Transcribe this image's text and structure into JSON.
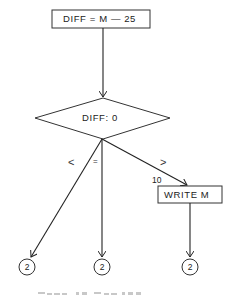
{
  "diagram": {
    "type": "flowchart",
    "nodes": {
      "assign": {
        "shape": "rectangle",
        "label": "DIFF = M — 25"
      },
      "decision": {
        "shape": "diamond",
        "label": "DIFF:  0"
      },
      "write": {
        "shape": "rectangle",
        "label": "WRITE   M",
        "step_number": "10"
      },
      "connectors": [
        {
          "shape": "circle",
          "label": "2"
        },
        {
          "shape": "circle",
          "label": "2"
        },
        {
          "shape": "circle",
          "label": "2"
        }
      ]
    },
    "edges": [
      {
        "from": "assign",
        "to": "decision",
        "label": ""
      },
      {
        "from": "decision",
        "to": "connector-1",
        "label": "<"
      },
      {
        "from": "decision",
        "to": "connector-2",
        "label": "="
      },
      {
        "from": "decision",
        "to": "write",
        "label": ">"
      },
      {
        "from": "write",
        "to": "connector-3",
        "label": ""
      }
    ]
  }
}
